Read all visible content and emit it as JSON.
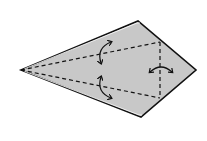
{
  "diagram": {
    "type": "origami-fold-diagram",
    "colors": {
      "paper_fill": "#c8c8c8",
      "outline": "#111111",
      "background": "#ffffff"
    },
    "vertices": {
      "left_tip": [
        21,
        70
      ],
      "top": [
        138,
        21
      ],
      "right_tip": [
        196,
        70
      ],
      "bottom": [
        141,
        117
      ]
    },
    "fold_lines": [
      {
        "name": "upper-diagonal-crease",
        "from": [
          21,
          70
        ],
        "to": [
          160,
          42
        ],
        "style": "dashed"
      },
      {
        "name": "lower-diagonal-crease",
        "from": [
          21,
          70
        ],
        "to": [
          160,
          98
        ],
        "style": "dashed"
      },
      {
        "name": "vertical-crease",
        "from": [
          160,
          42
        ],
        "to": [
          160,
          98
        ],
        "style": "dashed"
      }
    ],
    "arrows": [
      {
        "name": "upper-fold-unfold-arrow",
        "kind": "curved-double"
      },
      {
        "name": "lower-fold-unfold-arrow",
        "kind": "curved-double"
      },
      {
        "name": "right-fold-unfold-arrow",
        "kind": "curved-double"
      }
    ]
  }
}
